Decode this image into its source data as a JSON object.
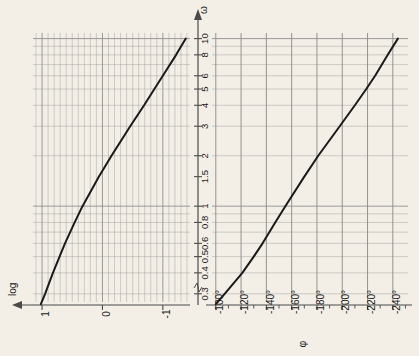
{
  "figure": {
    "background_color": "#f3efe7",
    "curve_color": "#1a1a1a",
    "grid_color": "#8e8e8e",
    "axis_color": "#4a4a4a"
  },
  "shared_axis": {
    "name": "omega-axis",
    "symbol": "ω",
    "scale": "log",
    "orientation": "vertical",
    "direction": "increasing upward",
    "range": [
      0.25,
      11
    ],
    "tick_labels": [
      "0.3",
      "0.4",
      "0.5",
      "0.6",
      "0.8",
      "1",
      "1.5",
      "2",
      "3",
      "4",
      "5",
      "6",
      "8",
      "10"
    ],
    "tick_values": [
      0.3,
      0.4,
      0.5,
      0.6,
      0.8,
      1,
      1.5,
      2,
      3,
      4,
      5,
      6,
      8,
      10
    ],
    "break_mark": "∿"
  },
  "chart_data": [
    {
      "type": "line",
      "name": "magnitude-plot",
      "title": "log magnitude",
      "xlabel": "log",
      "ylabel": "ω",
      "orientation": "rotated-90",
      "grid": true,
      "x_axis": {
        "label": "log",
        "scale": "linear",
        "tick_labels": [
          "1",
          "0",
          "-1"
        ],
        "tick_values": [
          1,
          0,
          -1
        ],
        "range": [
          1.15,
          -1.45
        ],
        "direction": "decreasing rightward",
        "minor_ticks_per_unit": 10
      },
      "y_axis": {
        "label": "ω",
        "scale": "log",
        "tick_values": [
          0.3,
          0.4,
          0.5,
          0.6,
          0.8,
          1,
          1.5,
          2,
          3,
          4,
          5,
          6,
          8,
          10
        ],
        "range": [
          0.25,
          11
        ]
      },
      "points": [
        {
          "omega": 0.26,
          "log": 1.02
        },
        {
          "omega": 0.3,
          "log": 0.95
        },
        {
          "omega": 0.4,
          "log": 0.82
        },
        {
          "omega": 0.5,
          "log": 0.71
        },
        {
          "omega": 0.6,
          "log": 0.62
        },
        {
          "omega": 0.8,
          "log": 0.46
        },
        {
          "omega": 1.0,
          "log": 0.33
        },
        {
          "omega": 1.5,
          "log": 0.06
        },
        {
          "omega": 2.0,
          "log": -0.15
        },
        {
          "omega": 3.0,
          "log": -0.46
        },
        {
          "omega": 4.0,
          "log": -0.69
        },
        {
          "omega": 5.0,
          "log": -0.86
        },
        {
          "omega": 6.0,
          "log": -1.0
        },
        {
          "omega": 8.0,
          "log": -1.22
        },
        {
          "omega": 10.0,
          "log": -1.38
        }
      ]
    },
    {
      "type": "line",
      "name": "phase-plot",
      "title": "phase",
      "xlabel": "φ",
      "ylabel": "ω",
      "orientation": "rotated-90",
      "grid": true,
      "x_axis": {
        "label": "φ",
        "scale": "linear",
        "unit": "degrees",
        "tick_labels": [
          "-100°",
          "-120°",
          "-140°",
          "-160°",
          "-180°",
          "-200°",
          "-220°",
          "-240°"
        ],
        "tick_values": [
          -100,
          -120,
          -140,
          -160,
          -180,
          -200,
          -220,
          -240
        ],
        "range": [
          -97,
          -252
        ],
        "direction": "decreasing rightward",
        "minor_tick_step": 10
      },
      "y_axis": {
        "label": "ω",
        "scale": "log",
        "tick_values": [
          0.3,
          0.4,
          0.5,
          0.6,
          0.8,
          1,
          1.5,
          2,
          3,
          4,
          5,
          6,
          8,
          10
        ],
        "range": [
          0.25,
          11
        ]
      },
      "points": [
        {
          "omega": 0.26,
          "phi": -100
        },
        {
          "omega": 0.3,
          "phi": -107
        },
        {
          "omega": 0.4,
          "phi": -121
        },
        {
          "omega": 0.5,
          "phi": -130
        },
        {
          "omega": 0.6,
          "phi": -137
        },
        {
          "omega": 0.8,
          "phi": -147
        },
        {
          "omega": 1.0,
          "phi": -155
        },
        {
          "omega": 1.5,
          "phi": -170
        },
        {
          "omega": 2.0,
          "phi": -181
        },
        {
          "omega": 3.0,
          "phi": -198
        },
        {
          "omega": 4.0,
          "phi": -210
        },
        {
          "omega": 5.0,
          "phi": -219
        },
        {
          "omega": 6.0,
          "phi": -226
        },
        {
          "omega": 8.0,
          "phi": -236
        },
        {
          "omega": 10.0,
          "phi": -244
        }
      ]
    }
  ]
}
